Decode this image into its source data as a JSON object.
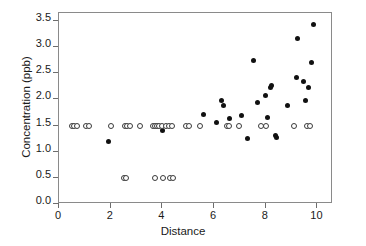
{
  "chart_data": {
    "type": "scatter",
    "title": "",
    "xlabel": "Distance",
    "ylabel": "Concentration (ppb)",
    "xlim": [
      0,
      10.6
    ],
    "ylim": [
      0.0,
      3.65
    ],
    "xticks": [
      0,
      2,
      4,
      6,
      8,
      10
    ],
    "xticklabels": [
      "0",
      "2",
      "4",
      "6",
      "8",
      "10"
    ],
    "yticks": [
      0.0,
      0.5,
      1.0,
      1.5,
      2.0,
      2.5,
      3.0,
      3.5
    ],
    "yticklabels": [
      "0.0",
      "0.5",
      "1.0",
      "1.5",
      "2.0",
      "2.5",
      "3.0",
      "3.5"
    ],
    "grid": false,
    "legend": false,
    "frame": true,
    "series": [
      {
        "name": "detected",
        "marker": "filled-circle",
        "color": "#111111",
        "points": [
          [
            1.92,
            1.19
          ],
          [
            4.02,
            1.4
          ],
          [
            5.58,
            1.71
          ],
          [
            6.08,
            1.56
          ],
          [
            6.27,
            1.98
          ],
          [
            6.38,
            1.89
          ],
          [
            6.58,
            1.63
          ],
          [
            7.06,
            1.69
          ],
          [
            7.3,
            1.26
          ],
          [
            7.54,
            2.74
          ],
          [
            7.68,
            1.94
          ],
          [
            7.98,
            2.07
          ],
          [
            8.05,
            1.66
          ],
          [
            8.18,
            2.22
          ],
          [
            8.22,
            2.27
          ],
          [
            8.38,
            1.31
          ],
          [
            8.41,
            1.28
          ],
          [
            8.83,
            1.88
          ],
          [
            9.18,
            2.42
          ],
          [
            9.22,
            3.17
          ],
          [
            9.46,
            2.34
          ],
          [
            9.55,
            1.98
          ],
          [
            9.66,
            2.22
          ],
          [
            9.77,
            2.7
          ],
          [
            9.86,
            3.43
          ]
        ]
      },
      {
        "name": "non-detect",
        "marker": "open-circle",
        "color": "#3a3a3a",
        "points": [
          [
            0.5,
            1.5
          ],
          [
            0.58,
            1.5
          ],
          [
            0.7,
            1.5
          ],
          [
            1.05,
            1.5
          ],
          [
            1.17,
            1.5
          ],
          [
            2.03,
            1.5
          ],
          [
            2.56,
            1.5
          ],
          [
            2.63,
            1.5
          ],
          [
            2.75,
            1.5
          ],
          [
            3.15,
            1.5
          ],
          [
            3.62,
            1.5
          ],
          [
            3.7,
            1.5
          ],
          [
            3.78,
            1.5
          ],
          [
            3.88,
            1.5
          ],
          [
            4.0,
            1.5
          ],
          [
            4.13,
            1.5
          ],
          [
            4.26,
            1.5
          ],
          [
            4.38,
            1.5
          ],
          [
            4.92,
            1.5
          ],
          [
            5.02,
            1.5
          ],
          [
            5.45,
            1.5
          ],
          [
            6.5,
            1.5
          ],
          [
            6.58,
            1.5
          ],
          [
            6.95,
            1.5
          ],
          [
            7.8,
            1.5
          ],
          [
            8.02,
            1.5
          ],
          [
            9.1,
            1.5
          ],
          [
            9.6,
            1.5
          ],
          [
            9.72,
            1.5
          ],
          [
            2.5,
            0.5
          ],
          [
            2.6,
            0.5
          ],
          [
            3.7,
            0.5
          ],
          [
            4.02,
            0.5
          ],
          [
            4.3,
            0.5
          ],
          [
            4.4,
            0.5
          ]
        ]
      }
    ]
  }
}
